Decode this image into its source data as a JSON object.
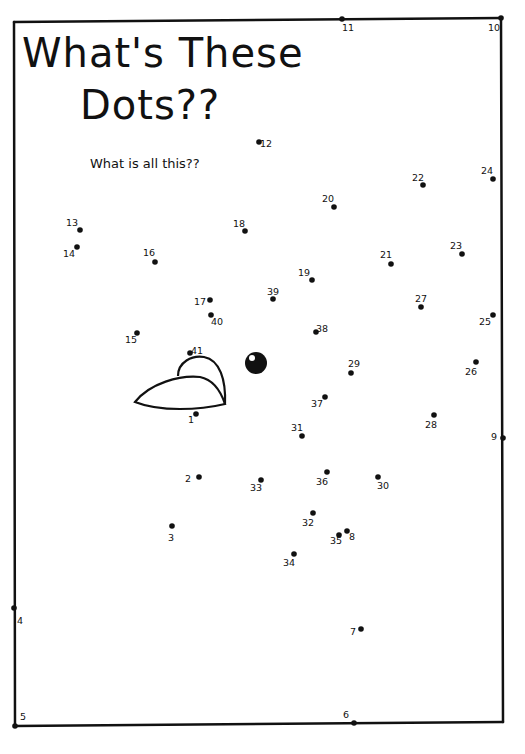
{
  "puzzle": {
    "title_line1": "What's These",
    "title_line2": "Dots??",
    "subtitle": "What is all this??",
    "ink_color": "#111111",
    "background_color": "#ffffff",
    "dots": [
      {
        "n": 1,
        "x": 196,
        "y": 414,
        "lx": -8,
        "ly": 9
      },
      {
        "n": 2,
        "x": 199,
        "y": 477,
        "lx": -14,
        "ly": 5
      },
      {
        "n": 3,
        "x": 172,
        "y": 526,
        "lx": -4,
        "ly": 15
      },
      {
        "n": 4,
        "x": 14,
        "y": 608,
        "lx": 3,
        "ly": 16
      },
      {
        "n": 5,
        "x": 15,
        "y": 726,
        "lx": 5,
        "ly": -6
      },
      {
        "n": 6,
        "x": 354,
        "y": 723,
        "lx": -11,
        "ly": -5
      },
      {
        "n": 7,
        "x": 361,
        "y": 629,
        "lx": -11,
        "ly": 6
      },
      {
        "n": 8,
        "x": 347,
        "y": 531,
        "lx": 2,
        "ly": 9
      },
      {
        "n": 9,
        "x": 503,
        "y": 438,
        "lx": -12,
        "ly": 2
      },
      {
        "n": 10,
        "x": 501,
        "y": 18,
        "lx": -13,
        "ly": 13
      },
      {
        "n": 11,
        "x": 342,
        "y": 19,
        "lx": 0,
        "ly": 12
      },
      {
        "n": 12,
        "x": 259,
        "y": 142,
        "lx": 1,
        "ly": 5
      },
      {
        "n": 13,
        "x": 80,
        "y": 230,
        "lx": -14,
        "ly": -4
      },
      {
        "n": 14,
        "x": 77,
        "y": 247,
        "lx": -14,
        "ly": 10
      },
      {
        "n": 15,
        "x": 137,
        "y": 333,
        "lx": -12,
        "ly": 10
      },
      {
        "n": 16,
        "x": 155,
        "y": 262,
        "lx": -12,
        "ly": -6
      },
      {
        "n": 17,
        "x": 210,
        "y": 300,
        "lx": -16,
        "ly": 5
      },
      {
        "n": 18,
        "x": 245,
        "y": 231,
        "lx": -12,
        "ly": -4
      },
      {
        "n": 19,
        "x": 312,
        "y": 280,
        "lx": -14,
        "ly": -4
      },
      {
        "n": 20,
        "x": 334,
        "y": 207,
        "lx": -12,
        "ly": -5
      },
      {
        "n": 21,
        "x": 391,
        "y": 264,
        "lx": -11,
        "ly": -6
      },
      {
        "n": 22,
        "x": 423,
        "y": 185,
        "lx": -11,
        "ly": -4
      },
      {
        "n": 23,
        "x": 462,
        "y": 254,
        "lx": -12,
        "ly": -5
      },
      {
        "n": 24,
        "x": 493,
        "y": 179,
        "lx": -12,
        "ly": -5
      },
      {
        "n": 25,
        "x": 493,
        "y": 315,
        "lx": -14,
        "ly": 10
      },
      {
        "n": 26,
        "x": 476,
        "y": 362,
        "lx": -11,
        "ly": 13
      },
      {
        "n": 27,
        "x": 421,
        "y": 307,
        "lx": -6,
        "ly": -5
      },
      {
        "n": 28,
        "x": 434,
        "y": 415,
        "lx": -9,
        "ly": 13
      },
      {
        "n": 29,
        "x": 351,
        "y": 373,
        "lx": -3,
        "ly": -6
      },
      {
        "n": 30,
        "x": 378,
        "y": 477,
        "lx": -1,
        "ly": 12
      },
      {
        "n": 31,
        "x": 302,
        "y": 436,
        "lx": -11,
        "ly": -5
      },
      {
        "n": 32,
        "x": 313,
        "y": 513,
        "lx": -11,
        "ly": 13
      },
      {
        "n": 33,
        "x": 261,
        "y": 480,
        "lx": -11,
        "ly": 11
      },
      {
        "n": 34,
        "x": 294,
        "y": 554,
        "lx": -11,
        "ly": 12
      },
      {
        "n": 35,
        "x": 339,
        "y": 535,
        "lx": -9,
        "ly": 9
      },
      {
        "n": 36,
        "x": 327,
        "y": 472,
        "lx": -11,
        "ly": 13
      },
      {
        "n": 37,
        "x": 325,
        "y": 397,
        "lx": -14,
        "ly": 10
      },
      {
        "n": 38,
        "x": 316,
        "y": 332,
        "lx": 0,
        "ly": 0
      },
      {
        "n": 39,
        "x": 273,
        "y": 299,
        "lx": -6,
        "ly": -4
      },
      {
        "n": 40,
        "x": 211,
        "y": 315,
        "lx": 0,
        "ly": 10
      },
      {
        "n": 41,
        "x": 190,
        "y": 353,
        "lx": 1,
        "ly": 1
      }
    ]
  }
}
